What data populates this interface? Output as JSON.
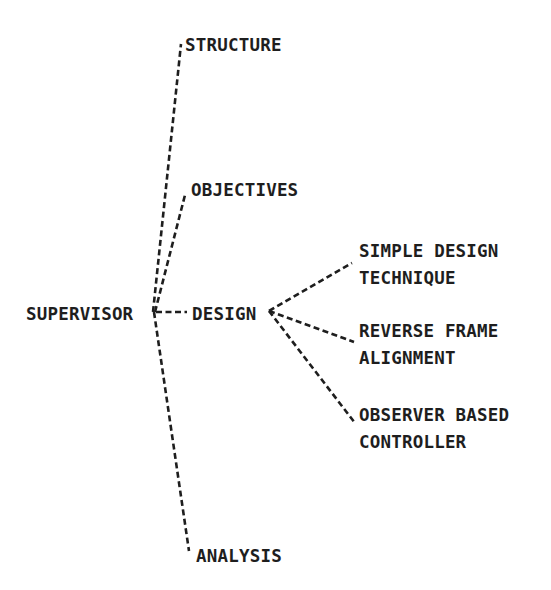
{
  "diagram": {
    "type": "tree",
    "line_style": "dashed",
    "color": "#1e1e1e",
    "root": {
      "id": "supervisor",
      "label": "SUPERVISOR",
      "children": [
        {
          "id": "structure",
          "label": "STRUCTURE"
        },
        {
          "id": "objectives",
          "label": "OBJECTIVES"
        },
        {
          "id": "design",
          "label": "DESIGN",
          "children": [
            {
              "id": "simple-design-technique",
              "lines": [
                "SIMPLE DESIGN",
                "TECHNIQUE"
              ]
            },
            {
              "id": "reverse-frame-alignment",
              "lines": [
                "REVERSE FRAME",
                "ALIGNMENT"
              ]
            },
            {
              "id": "observer-based-controller",
              "lines": [
                "OBSERVER BASED",
                "CONTROLLER"
              ]
            }
          ]
        },
        {
          "id": "analysis",
          "label": "ANALYSIS"
        }
      ]
    }
  },
  "nodes": {
    "supervisor": "SUPERVISOR",
    "structure": "STRUCTURE",
    "objectives": "OBJECTIVES",
    "design": "DESIGN",
    "simple_design_line1": "SIMPLE DESIGN",
    "simple_design_line2": "TECHNIQUE",
    "reverse_frame_line1": "REVERSE FRAME",
    "reverse_frame_line2": "ALIGNMENT",
    "observer_line1": "OBSERVER BASED",
    "observer_line2": "CONTROLLER",
    "analysis": "ANALYSIS"
  }
}
